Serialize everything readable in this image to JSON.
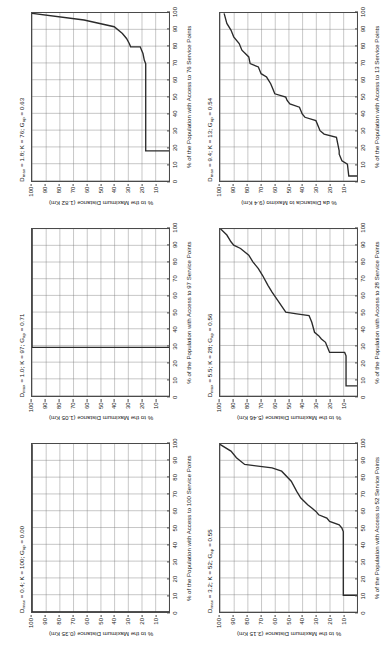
{
  "figure": {
    "layout": {
      "rows": 2,
      "columns": 3,
      "rotation_deg": -90
    },
    "colors": {
      "background": "#ffffff",
      "curve": "#2b2b2b",
      "axis": "#4a4a4a",
      "grid_major": "#787878",
      "grid_minor": "#969696"
    }
  },
  "chart_data": [
    {
      "type": "line",
      "id": "panel-dmax-0-4",
      "title": "D_max = 0.4; K = 100; G_ap = 0.00",
      "title_parts": {
        "dmax": "0.4",
        "k": "100",
        "gap": "0.00"
      },
      "xlabel": "% of the Population with Access to 100 Service Points",
      "ylabel": "% to the Maximum Distance (0.35 Km)",
      "max_distance_km": 0.35,
      "service_points": 100,
      "xlim": [
        0,
        100
      ],
      "ylim": [
        0,
        100
      ],
      "xticks": [
        0,
        10,
        20,
        30,
        40,
        50,
        60,
        70,
        80,
        90,
        100
      ],
      "yticks": [
        10,
        20,
        30,
        40,
        50,
        60,
        70,
        80,
        90,
        100
      ],
      "grid": true,
      "x": [
        0,
        0,
        100
      ],
      "y": [
        0,
        100,
        100
      ]
    },
    {
      "type": "line",
      "id": "panel-dmax-1-0",
      "title": "D_max = 1.0; K = 97; G_ap = 0.71",
      "title_parts": {
        "dmax": "1.0",
        "k": "97",
        "gap": "0.71"
      },
      "xlabel": "% of the Population with Access to 97 Service Points",
      "ylabel": "% to the Maximum Distance (1.05 Km)",
      "max_distance_km": 1.05,
      "service_points": 97,
      "xlim": [
        0,
        100
      ],
      "ylim": [
        0,
        100
      ],
      "xticks": [
        0,
        10,
        20,
        30,
        40,
        50,
        60,
        70,
        80,
        90,
        100
      ],
      "yticks": [
        10,
        20,
        30,
        40,
        50,
        60,
        70,
        80,
        90,
        100
      ],
      "grid": true,
      "x": [
        29,
        29,
        100
      ],
      "y": [
        0,
        100,
        100
      ]
    },
    {
      "type": "line",
      "id": "panel-dmax-1-8",
      "title": "D_max = 1.8; K = 76; G_ap = 0.63",
      "title_parts": {
        "dmax": "1.8",
        "k": "76",
        "gap": "0.63"
      },
      "xlabel": "% of the Population with Access to 76 Service Points",
      "ylabel": "% to the Maximum Distance (1.82 Km)",
      "max_distance_km": 1.82,
      "service_points": 76,
      "xlim": [
        0,
        100
      ],
      "ylim": [
        0,
        100
      ],
      "xticks": [
        0,
        10,
        20,
        30,
        40,
        50,
        60,
        70,
        80,
        90,
        100
      ],
      "yticks": [
        10,
        20,
        30,
        40,
        50,
        60,
        70,
        80,
        90,
        100
      ],
      "grid": true,
      "x": [
        18,
        18,
        70,
        72,
        76,
        78,
        80,
        80,
        82,
        85,
        88,
        92,
        96,
        100
      ],
      "y": [
        0,
        17,
        17,
        18,
        19,
        20,
        21,
        28,
        29,
        31,
        34,
        40,
        62,
        100
      ]
    },
    {
      "type": "line",
      "id": "panel-dmax-3-2",
      "title": "D_max = 3.2; K = 52; G_ap = 0.55",
      "title_parts": {
        "dmax": "3.2",
        "k": "52",
        "gap": "0.55"
      },
      "xlabel": "% of the Population with Access to 52 Service Points",
      "ylabel": "% to the Maximum Distance (3.15 Km)",
      "max_distance_km": 3.15,
      "service_points": 52,
      "xlim": [
        0,
        100
      ],
      "ylim": [
        0,
        100
      ],
      "xticks": [
        0,
        10,
        20,
        30,
        40,
        50,
        60,
        70,
        80,
        90,
        100
      ],
      "yticks": [
        10,
        20,
        30,
        40,
        50,
        60,
        70,
        80,
        90,
        100
      ],
      "grid": true,
      "x": [
        10,
        10,
        48,
        50,
        52,
        54,
        56,
        58,
        60,
        62,
        64,
        68,
        72,
        78,
        84,
        86,
        88,
        92,
        96,
        100
      ],
      "y": [
        0,
        10,
        10,
        11,
        13,
        20,
        22,
        28,
        30,
        33,
        36,
        41,
        44,
        48,
        55,
        62,
        82,
        88,
        92,
        100
      ]
    },
    {
      "type": "line",
      "id": "panel-dmax-5-5",
      "title": "D_max = 5.5; K = 28; G_ap = 0.56",
      "title_parts": {
        "dmax": "5.5",
        "k": "28",
        "gap": "0.56"
      },
      "xlabel": "% of the Population with Access to 28 Service Points",
      "ylabel": "% to the Maximum Distance (5.46 Km)",
      "max_distance_km": 5.46,
      "service_points": 28,
      "xlim": [
        0,
        100
      ],
      "ylim": [
        0,
        100
      ],
      "xticks": [
        0,
        10,
        20,
        30,
        40,
        50,
        60,
        70,
        80,
        90,
        100
      ],
      "yticks": [
        10,
        20,
        30,
        40,
        50,
        60,
        70,
        80,
        90,
        100
      ],
      "grid": true,
      "x": [
        6,
        6,
        24,
        26,
        26,
        30,
        32,
        34,
        36,
        38,
        44,
        48,
        49,
        50,
        62,
        66,
        72,
        76,
        80,
        84,
        88,
        90,
        92,
        96,
        100
      ],
      "y": [
        0,
        8,
        8,
        9,
        20,
        22,
        23,
        26,
        28,
        31,
        33,
        35,
        44,
        52,
        62,
        65,
        69,
        72,
        76,
        79,
        85,
        90,
        92,
        95,
        100
      ]
    },
    {
      "type": "line",
      "id": "panel-dmax-9-4",
      "title": "D_max = 9.4; K = 13; G_ap = 0.54",
      "title_parts": {
        "dmax": "9.4",
        "k": "13",
        "gap": "0.54"
      },
      "xlabel": "% of the Population with Access to 13 Service Points",
      "ylabel": "% da Distancia to Maximo (9.4 Km)",
      "max_distance_km": 9.4,
      "service_points": 13,
      "xlim": [
        0,
        100
      ],
      "ylim": [
        0,
        100
      ],
      "xticks": [
        0,
        10,
        20,
        30,
        40,
        50,
        60,
        70,
        80,
        90,
        100
      ],
      "yticks": [
        10,
        20,
        30,
        40,
        50,
        60,
        70,
        80,
        90,
        100
      ],
      "grid": true,
      "x": [
        3,
        3,
        10,
        12,
        14,
        16,
        18,
        22,
        26,
        28,
        30,
        32,
        36,
        38,
        40,
        44,
        46,
        48,
        50,
        52,
        56,
        58,
        62,
        64,
        68,
        70,
        74,
        78,
        82,
        86,
        90,
        94,
        100
      ],
      "y": [
        0,
        6,
        7,
        11,
        12,
        13,
        13,
        14,
        15,
        24,
        27,
        28,
        30,
        38,
        40,
        42,
        49,
        51,
        52,
        60,
        62,
        63,
        66,
        70,
        72,
        78,
        79,
        84,
        86,
        90,
        92,
        95,
        97
      ]
    }
  ]
}
